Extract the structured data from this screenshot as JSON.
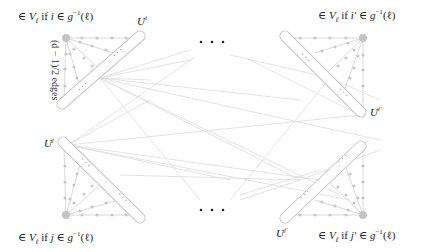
{
  "diagram": {
    "clusters": [
      {
        "id": "top-left",
        "set_label": "U^i",
        "set_text": "U",
        "set_sup": "i",
        "membership_label": "∈ V_ℓ if i ∈ g⁻¹(ℓ)",
        "mem_pre": "∈ ",
        "mem_V": "V",
        "mem_sub": "ℓ",
        "mem_mid": " if ",
        "mem_var": "i",
        "mem_in": " ∈ ",
        "mem_g": "g",
        "mem_sup": "−1",
        "mem_arg": "(ℓ)"
      },
      {
        "id": "top-right",
        "set_label": "U^{i'}",
        "set_text": "U",
        "set_sup": "i′",
        "membership_label": "∈ V_ℓ if i' ∈ g⁻¹(ℓ)",
        "mem_pre": "∈ ",
        "mem_V": "V",
        "mem_sub": "ℓ",
        "mem_mid": " if ",
        "mem_var": "i′",
        "mem_in": " ∈ ",
        "mem_g": "g",
        "mem_sup": "−1",
        "mem_arg": "(ℓ)"
      },
      {
        "id": "bottom-left",
        "set_label": "U^j",
        "set_text": "U",
        "set_sup": "j",
        "membership_label": "∈ V_ℓ if j ∈ g⁻¹(ℓ)",
        "mem_pre": "∈ ",
        "mem_V": "V",
        "mem_sub": "ℓ",
        "mem_mid": " if ",
        "mem_var": "j",
        "mem_in": " ∈ ",
        "mem_g": "g",
        "mem_sup": "−1",
        "mem_arg": "(ℓ)"
      },
      {
        "id": "bottom-right",
        "set_label": "U^{j'}",
        "set_text": "U",
        "set_sup": "j′",
        "membership_label": "∈ V_ℓ if j' ∈ g⁻¹(ℓ)",
        "mem_pre": "∈ ",
        "mem_V": "V",
        "mem_sub": "ℓ",
        "mem_mid": " if ",
        "mem_var": "j′",
        "mem_in": " ∈ ",
        "mem_g": "g",
        "mem_sup": "−1",
        "mem_arg": "(ℓ)"
      }
    ],
    "edge_annotation": "(d − 1)/2 edges",
    "ellipsis_top": "· · ·",
    "ellipsis_bottom": "· · ·",
    "colors": {
      "edges": "#d9d9d9",
      "paths": "#cccccc",
      "path_nodes": "#c8c8c8",
      "apex": "#c0c0c0",
      "capsule": "#bdbdbd",
      "text": "#222222"
    }
  }
}
